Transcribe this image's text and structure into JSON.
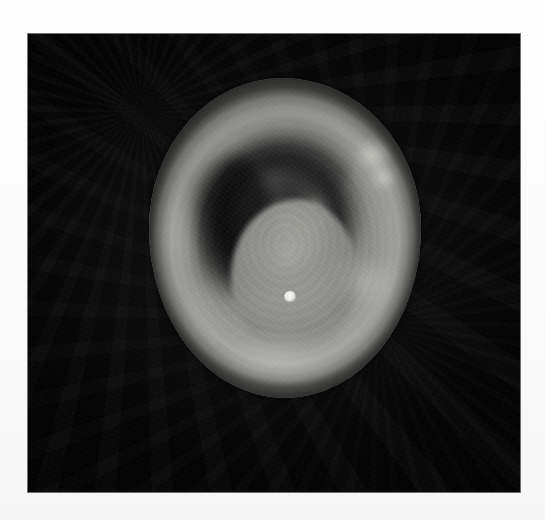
{
  "page": {
    "background_color": "#fafafa",
    "width": 545,
    "height": 520
  },
  "photo": {
    "name": "grayscale-endoscopic-photograph",
    "alt_text": "Grayscale endoscopic photograph of a circular tissue mass with a dark crescent-shaped lumen",
    "background_color": "#060606",
    "bounds": {
      "x": 28,
      "y": 34,
      "width": 492,
      "height": 458
    },
    "color_mode": "grayscale"
  },
  "specimen": {
    "label": "circular tissue mass",
    "bounds": {
      "x": 149,
      "y": 78,
      "width": 272,
      "height": 320
    },
    "base_color": "#93938f",
    "rim_color": "#cdcdc8",
    "features": [
      {
        "name": "top-notch",
        "label": "notch defect at superior margin"
      },
      {
        "name": "dark-crescent-lumen",
        "label": "dark crescent-shaped lumen",
        "color": "#0c0c0c"
      },
      {
        "name": "central-papilla",
        "label": "central rounded polypoid bulge",
        "color": "#a0a09c"
      },
      {
        "name": "specular-highlight",
        "label": "bright light reflection",
        "color": "#fbfbf8"
      },
      {
        "name": "right-wall-highlights",
        "label": "bright mucosal highlights on right wall"
      },
      {
        "name": "concentric-folds",
        "label": "faint concentric mucosal folds"
      }
    ]
  }
}
